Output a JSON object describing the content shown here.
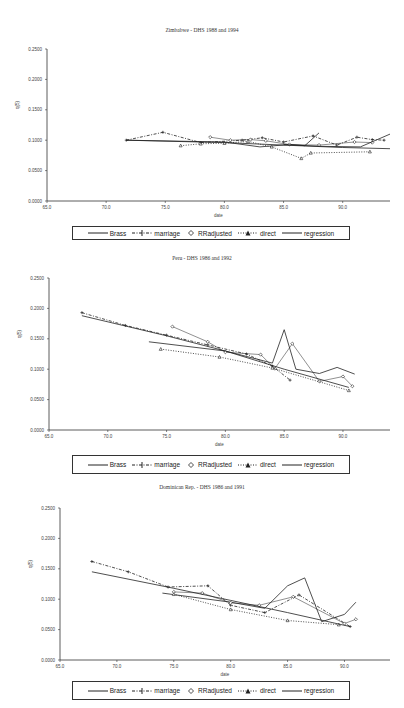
{
  "legend": {
    "items": [
      {
        "label": "Brass",
        "style": "solid"
      },
      {
        "label": "marriage",
        "style": "dash-plus"
      },
      {
        "label": "RRadjusted",
        "style": "diamond-marker"
      },
      {
        "label": "direct",
        "style": "dotted-triangle"
      },
      {
        "label": "regression",
        "style": "solid"
      }
    ]
  },
  "chart_data": [
    {
      "type": "line",
      "title": "Zimbabwe - DHS 1988 and 1994",
      "xlabel": "date",
      "ylabel": "q(5)",
      "xlim": [
        65.0,
        94.0
      ],
      "ylim": [
        0.0,
        0.25
      ],
      "x_ticks": [
        "65.0",
        "70.0",
        "75.0",
        "80.0",
        "85.0",
        "90.0"
      ],
      "y_ticks": [
        "0.0000",
        "0.0500",
        "0.1000",
        "0.1500",
        "0.2000",
        "0.2500"
      ],
      "legend_position": "bottom",
      "series": [
        {
          "name": "Brass",
          "x": [
            71.7,
            80.0,
            83.0,
            85.5,
            86.8,
            88.0
          ],
          "y": [
            0.1,
            0.097,
            0.089,
            0.093,
            0.091,
            0.112
          ]
        },
        {
          "name": "marriage",
          "x": [
            71.7,
            74.8,
            78.0,
            81.5,
            83.2,
            85.0,
            87.5,
            89.5,
            91.2,
            92.5,
            93.5
          ],
          "y": [
            0.1,
            0.113,
            0.096,
            0.1,
            0.104,
            0.097,
            0.107,
            0.092,
            0.105,
            0.101,
            0.1
          ]
        },
        {
          "name": "RRadjusted",
          "x": [
            78.8,
            80.5,
            82.2,
            83.5,
            85.5,
            88.0,
            91.0,
            92.5
          ],
          "y": [
            0.105,
            0.1,
            0.101,
            0.099,
            0.093,
            0.092,
            0.097,
            0.096
          ]
        },
        {
          "name": "direct",
          "x": [
            76.3,
            78.0,
            80.0,
            82.0,
            84.0,
            86.5,
            87.3,
            92.3
          ],
          "y": [
            0.091,
            0.094,
            0.095,
            0.098,
            0.089,
            0.07,
            0.079,
            0.081
          ]
        },
        {
          "name": "regression",
          "x": [
            71.7,
            80.0,
            85.0,
            90.0,
            94.0
          ],
          "y": [
            0.1,
            0.096,
            0.092,
            0.088,
            0.086
          ]
        },
        {
          "name": "Brass-late",
          "x": [
            85.0,
            88.0,
            91.5,
            94.0
          ],
          "y": [
            0.093,
            0.09,
            0.089,
            0.11
          ]
        }
      ]
    },
    {
      "type": "line",
      "title": "Peru - DHS 1986 and 1992",
      "xlabel": "date",
      "ylabel": "q(5)",
      "xlim": [
        65.0,
        94.0
      ],
      "ylim": [
        0.0,
        0.25
      ],
      "x_ticks": [
        "65.0",
        "70.0",
        "75.0",
        "80.0",
        "85.0",
        "90.0"
      ],
      "y_ticks": [
        "0.0000",
        "0.0500",
        "0.1000",
        "0.1500",
        "0.2000",
        "0.2500"
      ],
      "legend_position": "bottom",
      "series": [
        {
          "name": "Brass",
          "x": [
            73.5,
            80.0,
            84.0,
            85.0,
            86.0,
            88.0,
            89.5,
            91.0
          ],
          "y": [
            0.145,
            0.13,
            0.11,
            0.165,
            0.1,
            0.093,
            0.103,
            0.092
          ]
        },
        {
          "name": "marriage",
          "x": [
            67.8,
            71.5,
            75.0,
            78.5,
            81.8,
            84.0,
            85.5
          ],
          "y": [
            0.193,
            0.172,
            0.156,
            0.14,
            0.125,
            0.105,
            0.082
          ]
        },
        {
          "name": "RRadjusted",
          "x": [
            75.5,
            78.5,
            80.0,
            83.0,
            84.2,
            85.7,
            88.0,
            90.0,
            90.8
          ],
          "y": [
            0.17,
            0.145,
            0.128,
            0.124,
            0.101,
            0.142,
            0.08,
            0.088,
            0.072
          ]
        },
        {
          "name": "direct",
          "x": [
            74.5,
            79.5,
            84.0,
            90.5
          ],
          "y": [
            0.133,
            0.12,
            0.102,
            0.065
          ]
        },
        {
          "name": "regression",
          "x": [
            67.8,
            75.0,
            80.0,
            85.0,
            90.5
          ],
          "y": [
            0.188,
            0.155,
            0.13,
            0.1,
            0.07
          ]
        }
      ]
    },
    {
      "type": "line",
      "title": "Dominican Rep. - DHS 1986 and 1991",
      "xlabel": "date",
      "ylabel": "q(5)",
      "xlim": [
        65.0,
        94.0
      ],
      "ylim": [
        0.0,
        0.25
      ],
      "x_ticks": [
        "65.0",
        "70.0",
        "75.0",
        "80.0",
        "85.0",
        "90.0"
      ],
      "y_ticks": [
        "0.0000",
        "0.0500",
        "0.1000",
        "0.1500",
        "0.2000",
        "0.2500"
      ],
      "legend_position": "bottom",
      "series": [
        {
          "name": "Brass",
          "x": [
            74.0,
            80.0,
            83.0,
            85.0,
            86.5,
            88.0,
            90.0,
            91.0
          ],
          "y": [
            0.11,
            0.095,
            0.085,
            0.122,
            0.135,
            0.063,
            0.075,
            0.095
          ]
        },
        {
          "name": "marriage",
          "x": [
            67.8,
            71.0,
            74.5,
            78.0,
            80.0,
            83.0,
            86.0,
            90.5
          ],
          "y": [
            0.162,
            0.145,
            0.12,
            0.122,
            0.09,
            0.078,
            0.107,
            0.055
          ]
        },
        {
          "name": "RRadjusted",
          "x": [
            75.0,
            77.5,
            80.0,
            82.5,
            85.5,
            90.0,
            91.0
          ],
          "y": [
            0.112,
            0.11,
            0.094,
            0.09,
            0.104,
            0.06,
            0.067
          ]
        },
        {
          "name": "direct",
          "x": [
            75.0,
            80.0,
            85.0,
            89.5
          ],
          "y": [
            0.108,
            0.083,
            0.065,
            0.058
          ]
        },
        {
          "name": "regression",
          "x": [
            67.8,
            75.0,
            80.0,
            85.0,
            90.5
          ],
          "y": [
            0.145,
            0.118,
            0.098,
            0.078,
            0.055
          ]
        }
      ]
    }
  ]
}
